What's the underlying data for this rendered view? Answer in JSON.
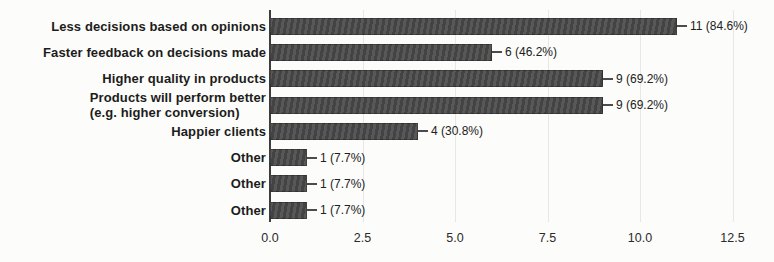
{
  "chart_data": {
    "type": "bar",
    "orientation": "horizontal",
    "title": "",
    "xlabel": "",
    "ylabel": "",
    "categories": [
      "Less decisions based on opinions",
      "Faster feedback on decisions made",
      "Higher quality in products",
      "Products will perform better\n(e.g. higher conversion)",
      "Happier clients",
      "Other",
      "Other",
      "Other"
    ],
    "values": [
      11,
      6,
      9,
      9,
      4,
      1,
      1,
      1
    ],
    "value_labels": [
      "11 (84.6%)",
      "6 (46.2%)",
      "9 (69.2%)",
      "9 (69.2%)",
      "4 (30.8%)",
      "1 (7.7%)",
      "1 (7.7%)",
      "1 (7.7%)"
    ],
    "x_ticks": [
      "0.0",
      "2.5",
      "5.0",
      "7.5",
      "10.0",
      "12.5"
    ],
    "x_tick_values": [
      0,
      2.5,
      5,
      7.5,
      10,
      12.5
    ],
    "xlim": [
      0,
      12.85
    ],
    "grid": "vertical-faint",
    "legend": "none",
    "colors": {
      "bar": "#4b4b4b",
      "axis": "#3d3d3d",
      "grid": "#e7e7e4",
      "label_text": "#1c1c1c",
      "value_text": "#212121",
      "tick_text": "#2b2b2b",
      "background": "#fcfcfa"
    }
  }
}
